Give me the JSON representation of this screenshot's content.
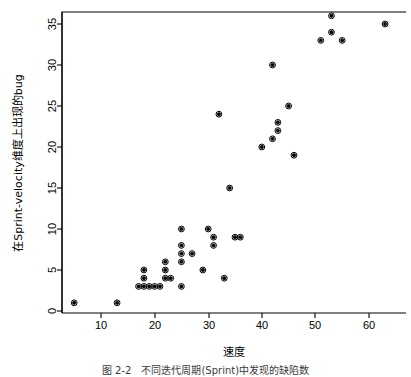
{
  "figure": {
    "background_color": "#ffffff",
    "foreground_color": "#000000",
    "caption": "图 2-2　不同迭代周期(Sprint)中发现的缺陷数"
  },
  "chart_data": {
    "type": "scatter",
    "title": "",
    "xlabel": "速度",
    "ylabel": "在Sprint-velocity维度上出现的bug",
    "xlim": [
      2,
      65
    ],
    "ylim": [
      -1,
      37
    ],
    "xticks": [
      10,
      20,
      30,
      40,
      50,
      60
    ],
    "yticks": [
      0,
      5,
      10,
      15,
      20,
      25,
      30,
      35
    ],
    "grid": false,
    "legend": "none",
    "marker": "filled-circle",
    "marker_color": "#000000",
    "points": [
      {
        "x": 5,
        "y": 1
      },
      {
        "x": 13,
        "y": 1
      },
      {
        "x": 17,
        "y": 3
      },
      {
        "x": 18,
        "y": 5
      },
      {
        "x": 18,
        "y": 4
      },
      {
        "x": 18,
        "y": 3
      },
      {
        "x": 19,
        "y": 3
      },
      {
        "x": 20,
        "y": 3
      },
      {
        "x": 21,
        "y": 3
      },
      {
        "x": 22,
        "y": 6
      },
      {
        "x": 22,
        "y": 5
      },
      {
        "x": 22,
        "y": 4
      },
      {
        "x": 23,
        "y": 4
      },
      {
        "x": 25,
        "y": 10
      },
      {
        "x": 25,
        "y": 8
      },
      {
        "x": 25,
        "y": 7
      },
      {
        "x": 25,
        "y": 6
      },
      {
        "x": 25,
        "y": 3
      },
      {
        "x": 27,
        "y": 7
      },
      {
        "x": 29,
        "y": 5
      },
      {
        "x": 30,
        "y": 10
      },
      {
        "x": 31,
        "y": 9
      },
      {
        "x": 31,
        "y": 8
      },
      {
        "x": 32,
        "y": 24
      },
      {
        "x": 33,
        "y": 4
      },
      {
        "x": 34,
        "y": 15
      },
      {
        "x": 35,
        "y": 9
      },
      {
        "x": 36,
        "y": 9
      },
      {
        "x": 40,
        "y": 20
      },
      {
        "x": 42,
        "y": 30
      },
      {
        "x": 42,
        "y": 21
      },
      {
        "x": 43,
        "y": 23
      },
      {
        "x": 43,
        "y": 22
      },
      {
        "x": 45,
        "y": 25
      },
      {
        "x": 46,
        "y": 19
      },
      {
        "x": 51,
        "y": 33
      },
      {
        "x": 53,
        "y": 36
      },
      {
        "x": 53,
        "y": 34
      },
      {
        "x": 55,
        "y": 33
      },
      {
        "x": 63,
        "y": 35
      }
    ]
  }
}
